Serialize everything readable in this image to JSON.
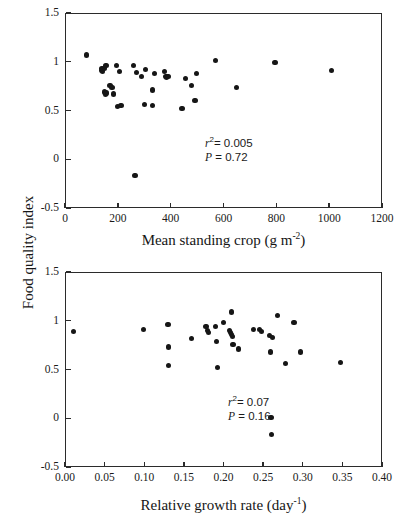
{
  "figure": {
    "shared_ylabel": "Food quality index"
  },
  "chart_data": [
    {
      "type": "scatter",
      "panel": "top",
      "title": "",
      "xlabel": "Mean standing crop (g m-2)",
      "xlabel_base": "Mean standing crop (g m",
      "xlabel_sup": "-2",
      "xlabel_tail": ")",
      "ylabel": "Food quality index",
      "xlim": [
        0,
        1200
      ],
      "ylim": [
        -0.5,
        1.5
      ],
      "xticks": [
        0,
        200,
        400,
        600,
        800,
        1000,
        1200
      ],
      "xticklabels": [
        "0",
        "200",
        "400",
        "600",
        "800",
        "1000",
        "1200"
      ],
      "yticks": [
        -0.5,
        0,
        0.5,
        1,
        1.5
      ],
      "yticklabels": [
        "-0.5",
        "0",
        "0.5",
        "1",
        "1.5"
      ],
      "grid": false,
      "legend": "none",
      "marker": "filled-circle",
      "marker_color": "#161616",
      "annotations": {
        "r_squared_label": "r",
        "r_squared_exponent": "2",
        "r_squared_value": "= 0.005",
        "p_label": "P",
        "p_value": "= 0.72"
      },
      "x": [
        80,
        137,
        140,
        142,
        148,
        150,
        152,
        155,
        158,
        170,
        178,
        185,
        195,
        198,
        205,
        212,
        258,
        265,
        272,
        290,
        300,
        305,
        330,
        332,
        338,
        378,
        382,
        385,
        390,
        443,
        455,
        480,
        492,
        498,
        570,
        648,
        795,
        1008
      ],
      "y": [
        1.07,
        0.91,
        0.93,
        0.9,
        0.93,
        0.69,
        0.67,
        0.96,
        0.68,
        0.76,
        0.74,
        0.67,
        0.96,
        0.54,
        0.9,
        0.55,
        0.96,
        -0.17,
        0.89,
        0.85,
        0.56,
        0.92,
        0.71,
        0.55,
        0.88,
        0.9,
        0.85,
        0.84,
        0.85,
        0.52,
        0.83,
        0.76,
        0.6,
        0.88,
        1.01,
        0.74,
        0.99,
        0.91
      ]
    },
    {
      "type": "scatter",
      "panel": "bottom",
      "title": "",
      "xlabel": "Relative growth rate (day-1)",
      "xlabel_base": "Relative growth rate (day",
      "xlabel_sup": "-1",
      "xlabel_tail": ")",
      "ylabel": "Food quality index",
      "xlim": [
        0.0,
        0.4
      ],
      "ylim": [
        -0.5,
        1.5
      ],
      "xticks": [
        0.0,
        0.05,
        0.1,
        0.15,
        0.2,
        0.25,
        0.3,
        0.35,
        0.4
      ],
      "xticklabels": [
        "0.00",
        "0.05",
        "0.10",
        "0.15",
        "0.20",
        "0.25",
        "0.30",
        "0.35",
        "0.40"
      ],
      "yticks": [
        -0.5,
        0,
        0.5,
        1,
        1.5
      ],
      "yticklabels": [
        "-0.5",
        "0",
        "0.5",
        "1",
        "1.5"
      ],
      "grid": false,
      "legend": "none",
      "marker": "filled-circle",
      "marker_color": "#161616",
      "annotations": {
        "r_squared_label": "r",
        "r_squared_exponent": "2",
        "r_squared_value": "= 0.07",
        "p_label": "P",
        "p_value": "= 0.16"
      },
      "x": [
        0.011,
        0.099,
        0.13,
        0.131,
        0.131,
        0.16,
        0.178,
        0.18,
        0.181,
        0.19,
        0.191,
        0.192,
        0.2,
        0.208,
        0.209,
        0.21,
        0.21,
        0.211,
        0.212,
        0.219,
        0.238,
        0.245,
        0.248,
        0.258,
        0.259,
        0.26,
        0.261,
        0.262,
        0.268,
        0.278,
        0.289,
        0.297,
        0.348
      ],
      "y": [
        0.89,
        0.91,
        0.96,
        0.73,
        0.54,
        0.82,
        0.94,
        0.9,
        0.88,
        0.94,
        0.79,
        0.52,
        0.98,
        0.9,
        0.88,
        0.86,
        1.09,
        0.84,
        0.76,
        0.71,
        0.91,
        0.91,
        0.89,
        0.85,
        0.68,
        0.01,
        -0.17,
        0.83,
        1.05,
        0.56,
        0.98,
        0.68,
        0.57
      ]
    }
  ]
}
